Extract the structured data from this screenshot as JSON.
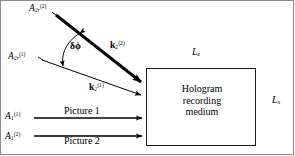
{
  "figure": {
    "background_color": "#ffffff",
    "line_color": "#000000",
    "frame_color": "#8d8d8d"
  },
  "beams": {
    "reference_beam_2": {
      "amplitude_label_base": "A",
      "amplitude_label_sub": "2r",
      "amplitude_label_sup": "(2)",
      "wavevector_base": "k",
      "wavevector_sub": "2",
      "wavevector_sup": "(2)",
      "style": "bold-thick-arrow"
    },
    "reference_beam_1": {
      "amplitude_label_base": "A",
      "amplitude_label_sub": "2r",
      "amplitude_label_sup": "(1)",
      "wavevector_base": "k",
      "wavevector_sub": "2",
      "wavevector_sup": "(1)",
      "style": "thin-arrow"
    },
    "object_beam_1": {
      "amplitude_label_base": "A",
      "amplitude_label_sub": "1",
      "amplitude_label_sup": "(1)",
      "caption": "Picture 1"
    },
    "object_beam_2": {
      "amplitude_label_base": "A",
      "amplitude_label_sub": "1",
      "amplitude_label_sup": "(2)",
      "caption": "Picture 2"
    }
  },
  "angle": {
    "label": "δϕ",
    "description": "angular separation between the two reference beams"
  },
  "medium": {
    "line1": "Hologram",
    "line2": "recording",
    "line3": "medium"
  },
  "dimensions": {
    "depth": {
      "base": "L",
      "sub": "z"
    },
    "transverse": {
      "base": "L",
      "sub": "x"
    }
  }
}
